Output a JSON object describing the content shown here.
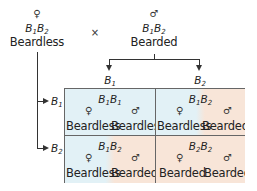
{
  "parents": {
    "female": {
      "symbol": "♀",
      "genotype": {
        "a": "B",
        "a_sub": "1",
        "b": "B",
        "b_sub": "2"
      },
      "phenotype": "Beardless"
    },
    "cross_symbol": "×",
    "male": {
      "symbol": "♂",
      "genotype": {
        "a": "B",
        "a_sub": "1",
        "b": "B",
        "b_sub": "2"
      },
      "phenotype": "Bearded"
    }
  },
  "gametes": {
    "male": [
      {
        "allele": "B",
        "sub": "1"
      },
      {
        "allele": "B",
        "sub": "2"
      }
    ],
    "female": [
      {
        "allele": "B",
        "sub": "1"
      },
      {
        "allele": "B",
        "sub": "2"
      }
    ]
  },
  "colors": {
    "beardless_bg": "#e2f1f6",
    "bearded_bg": "#f8e5d8",
    "line": "#333333",
    "grid_border": "#666666"
  },
  "punnett": [
    {
      "genotype": {
        "a": "B",
        "a_sub": "1",
        "b": "B",
        "b_sub": "1"
      },
      "female": {
        "symbol": "♀",
        "phenotype": "Beardless"
      },
      "male": {
        "symbol": "♂",
        "phenotype": "Beardless"
      }
    },
    {
      "genotype": {
        "a": "B",
        "a_sub": "1",
        "b": "B",
        "b_sub": "2"
      },
      "female": {
        "symbol": "♀",
        "phenotype": "Beardless"
      },
      "male": {
        "symbol": "♂",
        "phenotype": "Bearded"
      }
    },
    {
      "genotype": {
        "a": "B",
        "a_sub": "1",
        "b": "B",
        "b_sub": "2"
      },
      "female": {
        "symbol": "♀",
        "phenotype": "Beardless"
      },
      "male": {
        "symbol": "♂",
        "phenotype": "Bearded"
      }
    },
    {
      "genotype": {
        "a": "B",
        "a_sub": "2",
        "b": "B",
        "b_sub": "2"
      },
      "female": {
        "symbol": "♀",
        "phenotype": "Bearded"
      },
      "male": {
        "symbol": "♂",
        "phenotype": "Bearded"
      }
    }
  ]
}
